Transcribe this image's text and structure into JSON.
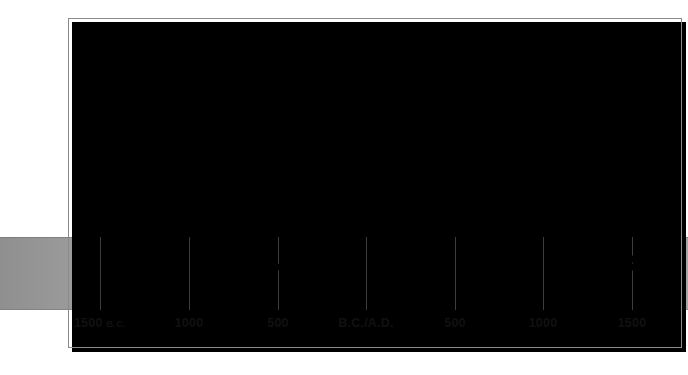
{
  "figure": {
    "band_label": "timeline-band"
  },
  "axis": {
    "ticks": [
      {
        "label": "1500",
        "era": "B.C.",
        "x": 100
      },
      {
        "label": "1000",
        "era": "",
        "x": 189
      },
      {
        "label": "500",
        "era": "",
        "x": 278
      },
      {
        "label": "B.C./A.D.",
        "era": "",
        "x": 366
      },
      {
        "label": "500",
        "era": "",
        "x": 455
      },
      {
        "label": "1000",
        "era": "",
        "x": 543
      },
      {
        "label": "1500",
        "era": "",
        "x": 632
      }
    ]
  },
  "events": [
    {
      "label": "Rise of Olmecs in Mexico",
      "dot_x": 152,
      "dot_y": 267,
      "label_x": 232,
      "label_y": 188,
      "leader_top": 198
    },
    {
      "label": "Mayas build a civilization",
      "dot_x": 277,
      "dot_y": 267,
      "label_x": 352,
      "label_y": 161,
      "leader_top": 171
    },
    {
      "label": "Hopewell and Hohokam cultures",
      "dot_x": 347,
      "dot_y": 267,
      "label_x": 352,
      "label_y": 137,
      "leader_top": 147
    },
    {
      "label": "Kingdom of Kush",
      "dot_x": 394,
      "dot_y": 267,
      "label_x": 420,
      "label_y": 110,
      "leader_top": 120
    },
    {
      "label": "Ethiopia becomes Christian",
      "dot_x": 419,
      "dot_y": 267,
      "label_x": 420,
      "label_y": 85,
      "leader_top": 95
    },
    {
      "label": "Rise of Ghana",
      "dot_x": 492,
      "dot_y": 267,
      "label_x": 541,
      "label_y": 188,
      "leader_top": 198
    },
    {
      "label": "East African trading cities",
      "dot_x": 564,
      "dot_y": 267,
      "label_x": 578,
      "label_y": 152,
      "leader_top": 162
    },
    {
      "label": "Songhai conquers Mali",
      "dot_x": 608,
      "dot_y": 267,
      "label_x": 617,
      "label_y": 111,
      "leader_top": 121
    },
    {
      "label": "Height of Aztec and Inca empires",
      "dot_x": 633,
      "dot_y": 267,
      "label_x": 655,
      "label_y": 67,
      "leader_top": 77
    },
    {
      "label": "Portuguese reach East Africa",
      "dot_x": 633,
      "dot_y": 259,
      "label_x": 655,
      "label_y": 44,
      "leader_top": 54
    }
  ],
  "colors": {
    "ink": "#000000",
    "frame": "#8a8a8a",
    "gridline": "#3c3c3c",
    "band_left": "#8f8f8f",
    "band_mid": "#cfcfcf",
    "band_right": "#a6a6a6",
    "page": "#ffffff"
  }
}
